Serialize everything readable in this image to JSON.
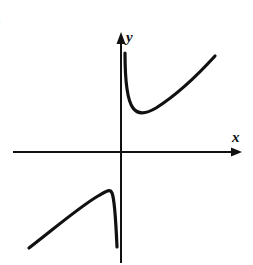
{
  "figure": {
    "partial_label": ")",
    "axes": {
      "x_label": "x",
      "y_label": "y",
      "origin_px": [
        121,
        152
      ]
    },
    "colors": {
      "stroke": "#111111",
      "background": "#ffffff"
    }
  }
}
